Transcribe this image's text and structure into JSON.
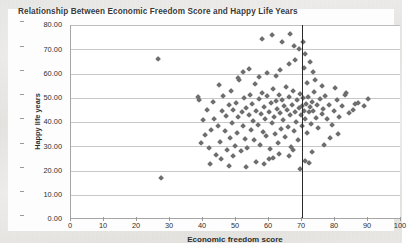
{
  "chart_data": {
    "type": "scatter",
    "title": "Relationship Between Economic Freedom Score and Happy Life Years",
    "xlabel": "Economic freedom score",
    "ylabel": "Happy life years",
    "xlim": [
      0,
      100
    ],
    "ylim": [
      0,
      80
    ],
    "xticks": [
      "0",
      "10",
      "20",
      "30",
      "40",
      "50",
      "60",
      "70",
      "80",
      "90",
      "100"
    ],
    "xtick_values": [
      0,
      10,
      20,
      30,
      40,
      50,
      60,
      70,
      80,
      90,
      100
    ],
    "yticks": [
      "0.00",
      "10.00",
      "20.00",
      "30.00",
      "40.00",
      "50.00",
      "60.00",
      "70.00",
      "80.00"
    ],
    "ytick_values": [
      0,
      10,
      20,
      30,
      40,
      50,
      60,
      70,
      80
    ],
    "grid": "horizontal",
    "legend": "none",
    "marker": "diamond",
    "marker_color": "#6e6e6e",
    "annotations": [
      {
        "kind": "vertical-line",
        "x": 70,
        "color": "#2a2a2a",
        "label": ""
      }
    ],
    "points": [
      [
        26.5,
        66.0
      ],
      [
        27.2,
        17.0
      ],
      [
        38.5,
        50.3
      ],
      [
        38.9,
        49.2
      ],
      [
        39.3,
        31.1
      ],
      [
        40.1,
        40.6
      ],
      [
        40.6,
        34.8
      ],
      [
        41.2,
        45.0
      ],
      [
        41.8,
        29.3
      ],
      [
        42.4,
        36.8
      ],
      [
        43.0,
        48.2
      ],
      [
        43.4,
        41.2
      ],
      [
        44.0,
        26.4
      ],
      [
        44.6,
        38.5
      ],
      [
        45.0,
        55.1
      ],
      [
        45.3,
        31.9
      ],
      [
        45.8,
        44.3
      ],
      [
        46.2,
        50.5
      ],
      [
        46.6,
        36.1
      ],
      [
        47.0,
        42.4
      ],
      [
        47.4,
        28.6
      ],
      [
        47.8,
        46.9
      ],
      [
        48.1,
        33.5
      ],
      [
        48.5,
        52.8
      ],
      [
        48.9,
        39.7
      ],
      [
        49.2,
        44.8
      ],
      [
        49.6,
        30.2
      ],
      [
        50.0,
        47.6
      ],
      [
        50.3,
        35.4
      ],
      [
        50.7,
        41.9
      ],
      [
        51.0,
        57.4
      ],
      [
        51.4,
        27.8
      ],
      [
        51.8,
        44.1
      ],
      [
        52.1,
        38.2
      ],
      [
        52.5,
        49.9
      ],
      [
        52.8,
        33.0
      ],
      [
        53.2,
        45.6
      ],
      [
        53.5,
        29.1
      ],
      [
        53.9,
        42.7
      ],
      [
        54.2,
        51.3
      ],
      [
        54.6,
        36.5
      ],
      [
        54.9,
        47.2
      ],
      [
        55.2,
        40.3
      ],
      [
        55.6,
        32.4
      ],
      [
        55.9,
        55.8
      ],
      [
        56.2,
        44.6
      ],
      [
        56.6,
        38.9
      ],
      [
        56.9,
        49.4
      ],
      [
        57.2,
        30.6
      ],
      [
        57.6,
        43.3
      ],
      [
        57.9,
        52.1
      ],
      [
        58.2,
        36.0
      ],
      [
        58.6,
        46.2
      ],
      [
        58.9,
        41.1
      ],
      [
        59.2,
        34.2
      ],
      [
        59.5,
        50.8
      ],
      [
        59.9,
        44.0
      ],
      [
        60.2,
        28.9
      ],
      [
        60.5,
        47.8
      ],
      [
        60.8,
        39.4
      ],
      [
        61.1,
        53.5
      ],
      [
        61.5,
        42.0
      ],
      [
        61.8,
        35.1
      ],
      [
        62.1,
        48.6
      ],
      [
        62.4,
        45.2
      ],
      [
        62.7,
        31.5
      ],
      [
        63.0,
        51.0
      ],
      [
        63.4,
        43.6
      ],
      [
        63.7,
        37.2
      ],
      [
        64.0,
        49.1
      ],
      [
        64.3,
        40.7
      ],
      [
        64.6,
        46.4
      ],
      [
        64.9,
        33.8
      ],
      [
        65.2,
        54.2
      ],
      [
        65.5,
        44.9
      ],
      [
        65.8,
        38.0
      ],
      [
        66.1,
        50.1
      ],
      [
        66.4,
        42.8
      ],
      [
        66.7,
        29.7
      ],
      [
        67.0,
        47.1
      ],
      [
        67.3,
        52.6
      ],
      [
        67.6,
        36.3
      ],
      [
        67.9,
        44.2
      ],
      [
        68.2,
        40.0
      ],
      [
        68.5,
        48.9
      ],
      [
        68.8,
        32.7
      ],
      [
        69.1,
        45.8
      ],
      [
        69.4,
        51.7
      ],
      [
        69.7,
        43.0
      ],
      [
        70.0,
        46.6
      ],
      [
        70.0,
        38.4
      ],
      [
        70.3,
        49.8
      ],
      [
        70.6,
        44.4
      ],
      [
        70.9,
        41.3
      ],
      [
        71.2,
        47.5
      ],
      [
        71.5,
        35.6
      ],
      [
        71.8,
        50.4
      ],
      [
        72.1,
        43.9
      ],
      [
        72.4,
        46.0
      ],
      [
        72.7,
        39.0
      ],
      [
        73.0,
        48.3
      ],
      [
        73.4,
        44.7
      ],
      [
        73.8,
        52.3
      ],
      [
        74.2,
        41.6
      ],
      [
        74.6,
        46.8
      ],
      [
        75.0,
        37.5
      ],
      [
        75.5,
        49.5
      ],
      [
        76.0,
        43.2
      ],
      [
        76.5,
        45.4
      ],
      [
        77.0,
        50.6
      ],
      [
        77.6,
        41.0
      ],
      [
        78.2,
        47.0
      ],
      [
        79.0,
        38.7
      ],
      [
        79.8,
        44.5
      ],
      [
        80.5,
        49.0
      ],
      [
        81.2,
        42.2
      ],
      [
        82.0,
        46.5
      ],
      [
        83.0,
        50.9
      ],
      [
        84.2,
        43.5
      ],
      [
        85.5,
        45.1
      ],
      [
        87.0,
        48.0
      ],
      [
        88.8,
        46.7
      ],
      [
        90.0,
        49.3
      ],
      [
        58.0,
        74.2
      ],
      [
        61.0,
        75.8
      ],
      [
        64.0,
        73.0
      ],
      [
        66.5,
        76.4
      ],
      [
        67.5,
        71.3
      ],
      [
        69.0,
        70.0
      ],
      [
        70.2,
        72.9
      ],
      [
        71.0,
        68.2
      ],
      [
        68.0,
        65.5
      ],
      [
        66.0,
        63.8
      ],
      [
        72.5,
        64.6
      ],
      [
        63.5,
        61.2
      ],
      [
        59.5,
        60.1
      ],
      [
        57.0,
        58.4
      ],
      [
        62.0,
        59.0
      ],
      [
        70.5,
        62.4
      ],
      [
        73.5,
        60.7
      ],
      [
        54.0,
        62.0
      ],
      [
        52.0,
        60.4
      ],
      [
        50.5,
        58.0
      ],
      [
        71.5,
        56.2
      ],
      [
        74.0,
        57.1
      ],
      [
        76.2,
        55.0
      ],
      [
        80.0,
        53.8
      ],
      [
        83.5,
        52.0
      ],
      [
        86.0,
        47.4
      ],
      [
        60.0,
        24.8
      ],
      [
        56.0,
        23.5
      ],
      [
        48.0,
        22.0
      ],
      [
        53.0,
        21.2
      ],
      [
        66.0,
        25.9
      ],
      [
        70.8,
        24.0
      ],
      [
        63.0,
        26.8
      ],
      [
        45.5,
        24.6
      ],
      [
        58.5,
        22.6
      ],
      [
        73.0,
        27.4
      ],
      [
        76.8,
        30.5
      ],
      [
        78.5,
        33.2
      ],
      [
        81.0,
        35.0
      ],
      [
        69.5,
        20.4
      ],
      [
        72.0,
        23.1
      ],
      [
        67.2,
        28.3
      ],
      [
        61.3,
        25.1
      ],
      [
        49.0,
        25.8
      ],
      [
        42.0,
        22.8
      ]
    ]
  }
}
